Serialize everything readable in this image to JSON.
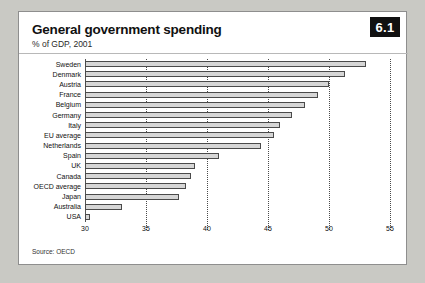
{
  "badge": {
    "label": "6.1"
  },
  "header": {
    "title": "General government spending",
    "subtitle": "% of GDP, 2001"
  },
  "footer": {
    "source": "Source: OECD"
  },
  "chart_data": {
    "type": "bar",
    "orientation": "horizontal",
    "title": "General government spending",
    "subtitle": "% of GDP, 2001",
    "xlabel": "",
    "ylabel": "",
    "xlim": [
      30,
      55
    ],
    "ticks": [
      30,
      35,
      40,
      45,
      50,
      55
    ],
    "tick_labels": [
      "30",
      "35",
      "40",
      "45",
      "50",
      "55"
    ],
    "grid": true,
    "legend": false,
    "source": "Source: OECD",
    "categories": [
      "Sweden",
      "Denmark",
      "Austria",
      "France",
      "Belgium",
      "Germany",
      "Italy",
      "EU average",
      "Netherlands",
      "Spain",
      "UK",
      "Canada",
      "OECD average",
      "Japan",
      "Australia",
      "USA"
    ],
    "values": [
      53.0,
      51.3,
      50.0,
      49.1,
      48.0,
      47.0,
      46.0,
      45.5,
      44.4,
      41.0,
      39.0,
      38.7,
      38.3,
      37.7,
      33.0,
      30.4
    ]
  }
}
